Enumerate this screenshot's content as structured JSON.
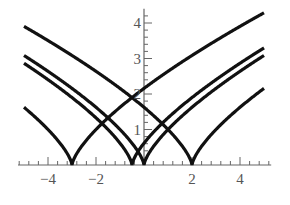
{
  "chart_data": {
    "type": "line",
    "title": "",
    "xlabel": "",
    "ylabel": "",
    "xlim": [
      -5.25,
      5.3
    ],
    "ylim": [
      0,
      4.4
    ],
    "grid": false,
    "legend": null,
    "x_ticks": [
      -4,
      -2,
      2,
      4
    ],
    "x_tick_labels": [
      "−4",
      "−2",
      "2",
      "4"
    ],
    "y_ticks": [
      1,
      2,
      3,
      4
    ],
    "y_tick_labels": [
      "1",
      "2",
      "3",
      "4"
    ],
    "x_minor_step": 0.4,
    "y_minor_step": 0.2,
    "x_range": [
      -5,
      5
    ],
    "series": [
      {
        "name": "|x+3|^0.7",
        "cusp": -3,
        "power": 0.7,
        "endpoints": {
          "x=-5": 1.62,
          "x=5": 4.29
        }
      },
      {
        "name": "|x+0.5|^0.7",
        "cusp": -0.5,
        "power": 0.7,
        "endpoints": {
          "x=-5": 2.87,
          "x=5": 3.3
        }
      },
      {
        "name": "|x|^0.7",
        "cusp": 0,
        "power": 0.7,
        "endpoints": {
          "x=-5": 3.09,
          "x=5": 3.09
        }
      },
      {
        "name": "|x-2|^0.7",
        "cusp": 2,
        "power": 0.7,
        "endpoints": {
          "x=-5": 3.9,
          "x=5": 2.16
        }
      }
    ],
    "line_color": "#111111"
  }
}
